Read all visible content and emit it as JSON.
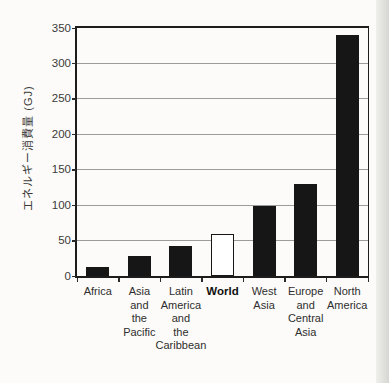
{
  "figure": {
    "background_color": "#fcfbf9",
    "page_edge_color_inner": "#efefec",
    "page_edge_color_outer": "#d6d6d3"
  },
  "chart_data": {
    "type": "bar",
    "title": "",
    "xlabel": "",
    "ylabel": "エネルギー消費量 (GJ)",
    "ylim": [
      0,
      350
    ],
    "ytick_interval": 50,
    "yticks": [
      0,
      50,
      100,
      150,
      200,
      250,
      300,
      350
    ],
    "grid": true,
    "legend": false,
    "categories": [
      "Africa",
      "Asia and the Pacific",
      "Latin America and the Caribbean",
      "World",
      "West Asia",
      "Europe and Central Asia",
      "North America"
    ],
    "category_label_lines": [
      [
        "Africa"
      ],
      [
        "Asia",
        "and",
        "the",
        "Pacific"
      ],
      [
        "Latin",
        "America",
        "and",
        "the",
        "Caribbean"
      ],
      [
        "World"
      ],
      [
        "West",
        "Asia"
      ],
      [
        "Europe",
        "and",
        "Central",
        "Asia"
      ],
      [
        "North",
        "America"
      ]
    ],
    "values": [
      13,
      28,
      42,
      60,
      99,
      130,
      340
    ],
    "emphasized_category": "World",
    "bar_color": "#161616",
    "emphasized_bar_fill": "#ffffff",
    "gridline_color": "#9b9b9b",
    "axis_color": "#1c1c1c"
  }
}
